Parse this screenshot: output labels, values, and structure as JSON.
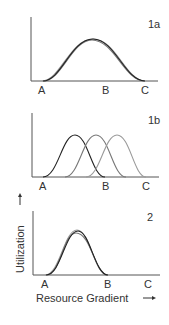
{
  "figure": {
    "y_axis_label": "Utilization",
    "x_axis_label": "Resource Gradient",
    "y_arrow": "up-arrow-icon",
    "x_arrow": "right-arrow-icon",
    "panels": [
      {
        "id": "1a",
        "label": "1a",
        "tick_labels": [
          "A",
          "B",
          "C"
        ],
        "description": "Several overlapping curves spanning A to C (wide, identical niches)"
      },
      {
        "id": "1b",
        "label": "1b",
        "tick_labels": [
          "A",
          "B",
          "C"
        ],
        "description": "Three shifted curves: first from A to B, third ending at C (partitioned niches)"
      },
      {
        "id": "2",
        "label": "2",
        "tick_labels": [
          "A",
          "B",
          "C"
        ],
        "description": "Several overlapping narrow curves spanning A to B"
      }
    ]
  },
  "colors": {
    "axis": "#555555",
    "curve_dark": "#222222",
    "curve_mid": "#777777",
    "curve_light": "#9a9a9a"
  }
}
